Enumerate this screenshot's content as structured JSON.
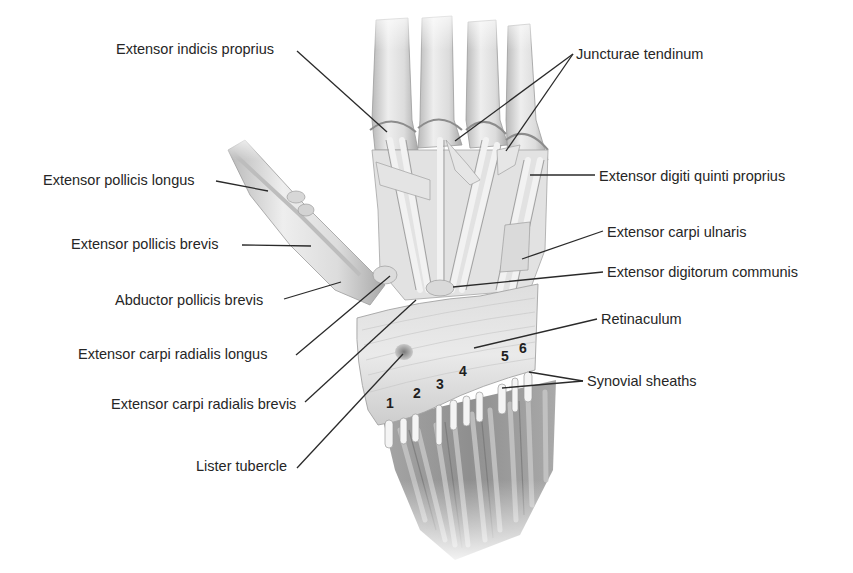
{
  "figure": {
    "colors": {
      "background": "#ffffff",
      "label_text": "#262626",
      "leader_line": "#2a2a2a",
      "tendon_light": "#e9e9e9",
      "tendon_mid": "#cfcfcf",
      "tendon_shadow": "#9a9a9a",
      "muscle_dark": "#8e8e8e",
      "lister_tubercle": "#8a8a8a"
    }
  },
  "labels": [
    {
      "id": "extensor-indicis-proprius",
      "text": "Extensor indicis proprius",
      "x": 116,
      "y": 41,
      "line": [
        [
          297,
          51
        ],
        [
          387,
          132
        ]
      ]
    },
    {
      "id": "juncturae-tendinum",
      "text": "Juncturae tendinum",
      "x": 576,
      "y": 46,
      "line": [
        [
          573,
          54
        ],
        [
          455,
          141
        ]
      ],
      "line2": [
        [
          573,
          54
        ],
        [
          506,
          151
        ]
      ]
    },
    {
      "id": "extensor-pollicis-longus",
      "text": "Extensor pollicis longus",
      "x": 43,
      "y": 172,
      "line": [
        [
          216,
          181
        ],
        [
          268,
          191
        ]
      ]
    },
    {
      "id": "extensor-digiti-quinti-proprius",
      "text": "Extensor digiti quinti proprius",
      "x": 599,
      "y": 168,
      "line": [
        [
          595,
          175
        ],
        [
          530,
          175
        ]
      ]
    },
    {
      "id": "extensor-pollicis-brevis",
      "text": "Extensor pollicis brevis",
      "x": 71,
      "y": 236,
      "line": [
        [
          242,
          245
        ],
        [
          311,
          246
        ]
      ]
    },
    {
      "id": "extensor-carpi-ulnaris",
      "text": "Extensor carpi ulnaris",
      "x": 607,
      "y": 224,
      "line": [
        [
          603,
          231
        ],
        [
          522,
          259
        ]
      ]
    },
    {
      "id": "abductor-pollicis-brevis",
      "text": "Abductor pollicis brevis",
      "x": 115,
      "y": 292,
      "line": [
        [
          284,
          299
        ],
        [
          341,
          282
        ]
      ]
    },
    {
      "id": "extensor-digitorum-communis",
      "text": "Extensor digitorum communis",
      "x": 607,
      "y": 264,
      "line": [
        [
          603,
          272
        ],
        [
          453,
          287
        ]
      ]
    },
    {
      "id": "retinaculum",
      "text": "Retinaculum",
      "x": 601,
      "y": 311,
      "line": [
        [
          597,
          319
        ],
        [
          474,
          348
        ]
      ]
    },
    {
      "id": "extensor-carpi-radialis-longus",
      "text": "Extensor carpi radialis longus",
      "x": 78,
      "y": 346,
      "line": [
        [
          296,
          355
        ],
        [
          390,
          276
        ]
      ]
    },
    {
      "id": "synovial-sheaths",
      "text": "Synovial sheaths",
      "x": 587,
      "y": 373,
      "line": [
        [
          583,
          381
        ],
        [
          529,
          372
        ]
      ],
      "line2": [
        [
          583,
          381
        ],
        [
          502,
          388
        ]
      ]
    },
    {
      "id": "extensor-carpi-radialis-brevis",
      "text": "Extensor carpi radialis brevis",
      "x": 111,
      "y": 396,
      "line": [
        [
          305,
          402
        ],
        [
          416,
          300
        ]
      ]
    },
    {
      "id": "lister-tubercle",
      "text": "Lister tubercle",
      "x": 196,
      "y": 458,
      "line": [
        [
          297,
          468
        ],
        [
          403,
          354
        ]
      ]
    }
  ],
  "compartments": [
    {
      "n": "1",
      "x": 386,
      "y": 396
    },
    {
      "n": "2",
      "x": 413,
      "y": 386
    },
    {
      "n": "3",
      "x": 436,
      "y": 377
    },
    {
      "n": "4",
      "x": 459,
      "y": 364
    },
    {
      "n": "5",
      "x": 501,
      "y": 349
    },
    {
      "n": "6",
      "x": 519,
      "y": 341
    }
  ]
}
